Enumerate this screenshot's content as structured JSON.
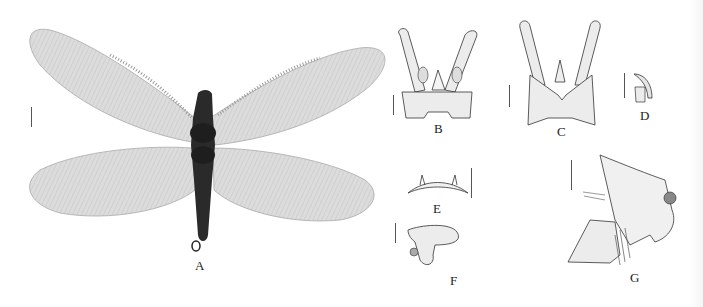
{
  "figure": {
    "panels": [
      {
        "id": "A",
        "label": "A",
        "subject": "adult habitus, dorsal view (wings spread)"
      },
      {
        "id": "B",
        "label": "B",
        "subject": "male genitalia, dorsal view"
      },
      {
        "id": "C",
        "label": "C",
        "subject": "male genitalia, ventral view"
      },
      {
        "id": "D",
        "label": "D",
        "subject": "gonostylus detail, lateral view"
      },
      {
        "id": "E",
        "label": "E",
        "subject": "sclerite, frontal view"
      },
      {
        "id": "F",
        "label": "F",
        "subject": "sclerite with lobe, lateral view"
      },
      {
        "id": "G",
        "label": "G",
        "subject": "terminalia, lateral view"
      }
    ],
    "colors": {
      "background": "#ffffff",
      "line": "#333333",
      "wing_fill": "#d9d9d9",
      "body_fill": "#2a2a2a",
      "stipple_fill": "#ececec"
    }
  }
}
